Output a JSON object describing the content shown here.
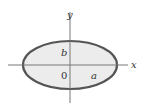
{
  "diagram": {
    "axes": {
      "x_label": "x",
      "y_label": "y"
    },
    "labels": {
      "origin": "0",
      "semi_major": "a",
      "semi_minor": "b"
    },
    "ellipse": {
      "cx": 70,
      "cy": 65,
      "rx": 47,
      "ry": 24,
      "fill": "#ececec",
      "stroke": "#555555"
    }
  }
}
